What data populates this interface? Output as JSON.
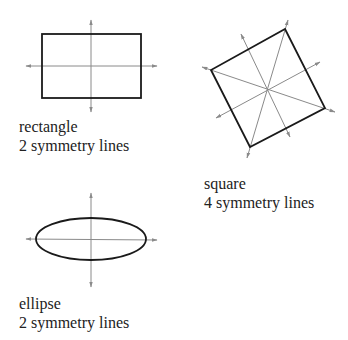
{
  "shapes": [
    {
      "name": "rectangle",
      "label": "rectangle",
      "caption": "2 symmetry lines"
    },
    {
      "name": "square",
      "label": "square",
      "caption": "4 symmetry lines"
    },
    {
      "name": "ellipse",
      "label": "ellipse",
      "caption": "2 symmetry lines"
    }
  ],
  "colors": {
    "outline": "#1a1a1a",
    "axis": "#8a8a8a"
  }
}
